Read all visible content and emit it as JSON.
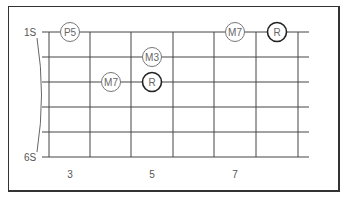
{
  "diagram": {
    "type": "guitar-fretboard",
    "string_labels": {
      "top": "1S",
      "bottom": "6S"
    },
    "fret_numbers": [
      {
        "label": "3",
        "x": 70
      },
      {
        "label": "5",
        "x": 152
      },
      {
        "label": "7",
        "x": 235
      }
    ],
    "notes": [
      {
        "label": "P5",
        "string": 1,
        "x": 70,
        "bold": false
      },
      {
        "label": "M7",
        "string": 1,
        "x": 235,
        "bold": false
      },
      {
        "label": "R",
        "string": 1,
        "x": 277,
        "bold": true
      },
      {
        "label": "M3",
        "string": 2,
        "x": 152,
        "bold": false
      },
      {
        "label": "M7",
        "string": 3,
        "x": 111,
        "bold": false
      },
      {
        "label": "R",
        "string": 3,
        "x": 152,
        "bold": true
      }
    ],
    "colors": {
      "line": "#444444",
      "frame": "#333333",
      "text": "#555555"
    }
  }
}
